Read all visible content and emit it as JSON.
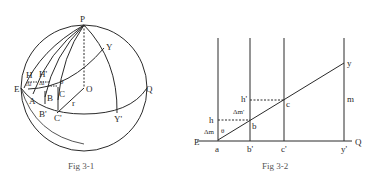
{
  "figures": [
    {
      "id": "fig1",
      "caption": "Fig 3-1",
      "labels": {
        "P": "P",
        "Y": "Y",
        "H": "H",
        "H2": "H'",
        "dl1": "Δl",
        "dl2": "Δl",
        "theta": "θ",
        "E": "E",
        "O": "O",
        "Q": "Q",
        "A": "A",
        "B": "B",
        "C": "C",
        "r": "r",
        "B2": "B'",
        "C2": "C'",
        "Y2": "Y'"
      }
    },
    {
      "id": "fig2",
      "caption": "Fig 3-2",
      "labels": {
        "y": "y",
        "m": "m",
        "h2": "h'",
        "c": "c",
        "dm2": "Δm'",
        "h": "h",
        "b": "b",
        "dm": "Δm",
        "theta": "θ",
        "E": "E",
        "Q": "Q",
        "a": "a",
        "b2": "b'",
        "c2": "c'",
        "y2": "y'"
      }
    }
  ],
  "colors": {
    "line": "#2a2a2a",
    "caption": "#555555"
  }
}
